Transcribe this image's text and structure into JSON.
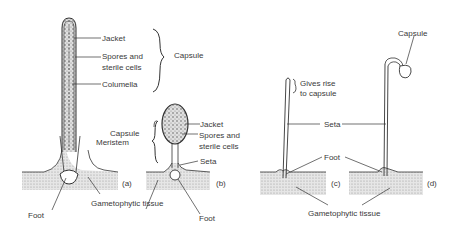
{
  "figure": {
    "panels": [
      {
        "id": "a",
        "label": "(a)"
      },
      {
        "id": "b",
        "label": "(b)"
      },
      {
        "id": "c",
        "label": "(c)"
      },
      {
        "id": "d",
        "label": "(d)"
      }
    ],
    "labels_a": {
      "jacket": "Jacket",
      "spores_1": "Spores and",
      "spores_2": "sterile cells",
      "columella": "Columella",
      "capsule": "Capsule",
      "meristem": "Meristem",
      "foot": "Foot",
      "gametophytic": "Gametophytic tissue"
    },
    "labels_b": {
      "capsule": "Capsule",
      "jacket": "Jacket",
      "spores_1": "Spores and",
      "spores_2": "sterile cells",
      "seta": "Seta",
      "foot": "Foot"
    },
    "labels_cd": {
      "gives_1": "Gives rise",
      "gives_2": "to capsule",
      "capsule": "Capsule",
      "seta": "Seta",
      "foot": "Foot",
      "gametophytic": "Gametophytic tissue"
    },
    "colors": {
      "line": "#333333",
      "tissue": "#d9d9d9",
      "capsule_fill": "#cfcfcf"
    }
  }
}
